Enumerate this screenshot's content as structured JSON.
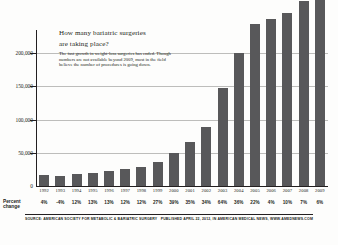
{
  "headline": {
    "line1": "How many bariatric surgeries",
    "line2": "are taking place?",
    "body": "The fast growth in weight-loss surgeries has ended. Though numbers are not available beyond 2009, most in the field believe the number of procedures is going down."
  },
  "percent_row_label_line1": "Percent",
  "percent_row_label_line2": "change",
  "footer": {
    "source": "SOURCE: AMERICAN SOCIETY FOR METABOLIC & BARIATRIC SURGERY",
    "published": "PUBLISHED APRIL 22, 2012, IN AMERICAN MEDICAL NEWS, WWW.AMEDNEWS.COM"
  },
  "colors": {
    "bar": "#58585a",
    "axis": "#231f20",
    "grid": "#bdbdbb",
    "background": "#fdfdfc"
  },
  "chart_data": {
    "type": "bar",
    "title": "How many bariatric surgeries are taking place?",
    "xlabel": "",
    "ylabel": "",
    "ylim": [
      0,
      235000
    ],
    "grid": true,
    "legend": "none",
    "ytick_labels": [
      "200,000",
      "150,000",
      "100,000",
      "50,000",
      "0"
    ],
    "ytick_values": [
      200000,
      150000,
      100000,
      50000,
      0
    ],
    "categories": [
      "1992",
      "1993",
      "1994",
      "1995",
      "1996",
      "1997",
      "1998",
      "1999",
      "2000",
      "2001",
      "2002",
      "2003",
      "2004",
      "2005",
      "2006",
      "2007",
      "2008",
      "2009"
    ],
    "values": [
      16200,
      15600,
      17500,
      19700,
      22300,
      25000,
      28000,
      35600,
      49500,
      66800,
      89600,
      146900,
      199800,
      243800,
      250900,
      261100,
      279400,
      296200
    ],
    "annotations": {
      "percent_change": [
        "4%",
        "-4%",
        "12%",
        "13%",
        "13%",
        "12%",
        "12%",
        "27%",
        "39%",
        "35%",
        "34%",
        "64%",
        "36%",
        "22%",
        "4%",
        "10%",
        "7%",
        "6%"
      ]
    },
    "bar_pixel_fractions": [
      0.072,
      0.068,
      0.078,
      0.087,
      0.099,
      0.111,
      0.124,
      0.158,
      0.22,
      0.297,
      0.398,
      0.653,
      0.888,
      1.0,
      1.0,
      1.0,
      1.0,
      1.0
    ]
  }
}
